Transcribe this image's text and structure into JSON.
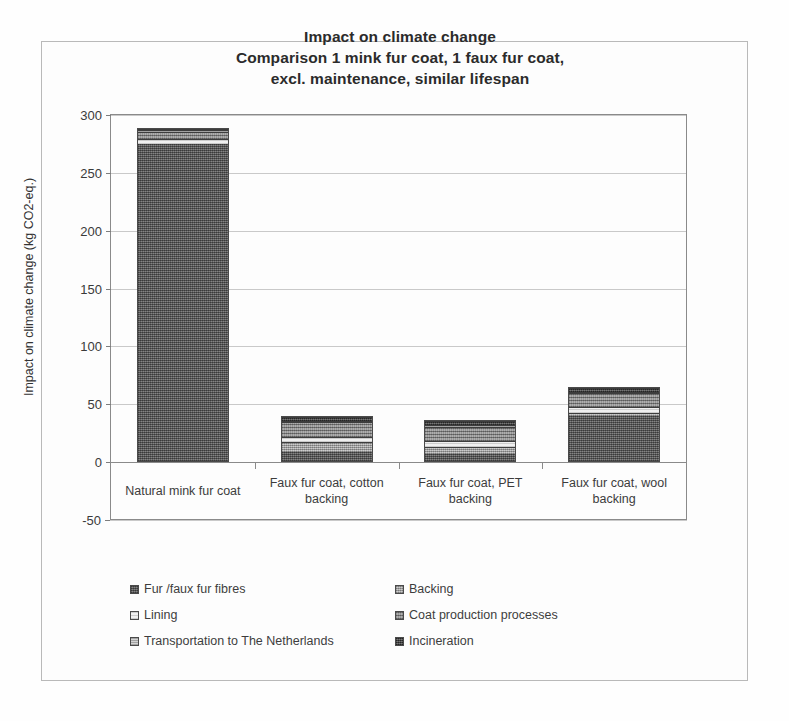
{
  "figure": {
    "title_lines": [
      "Impact on climate change",
      "Comparison 1 mink fur coat, 1 faux fur coat,",
      "excl. maintenance, similar lifespan"
    ]
  },
  "chart_data": {
    "type": "bar",
    "subtype": "stacked-bar",
    "title": "Impact on climate change Comparison 1 mink fur coat, 1 faux fur coat, excl. maintenance, similar lifespan",
    "xlabel": "",
    "ylabel": "Impact on climate change (kg CO2-eq.)",
    "ylim": [
      -50,
      300
    ],
    "yticks": [
      300,
      250,
      200,
      150,
      100,
      50,
      0,
      -50
    ],
    "ytick_labels": [
      "300",
      "250",
      "200",
      "150",
      "100",
      "50",
      "0",
      "-50"
    ],
    "grid": true,
    "legend_position": "bottom",
    "categories": [
      "Natural mink fur coat",
      "Faux fur coat, cotton backing",
      "Faux fur coat, PET backing",
      "Faux fur coat, wool backing"
    ],
    "series": [
      {
        "name": "Fur /faux fur fibres",
        "values": [
          276.0,
          8.0,
          6.0,
          40.0
        ]
      },
      {
        "name": "Backing",
        "values": [
          0.0,
          9.0,
          7.0,
          3.0
        ]
      },
      {
        "name": "Lining",
        "values": [
          4.0,
          5.0,
          5.0,
          5.0
        ]
      },
      {
        "name": "Coat production processes",
        "values": [
          6.0,
          13.0,
          13.0,
          12.0
        ]
      },
      {
        "name": "Transportation to The Netherlands",
        "values": [
          1.5,
          1.5,
          1.5,
          1.5
        ]
      },
      {
        "name": "Incineration",
        "values": [
          1.5,
          3.5,
          3.5,
          3.5
        ]
      }
    ],
    "totals": [
      289.0,
      40.0,
      36.0,
      65.0
    ]
  },
  "legend": {
    "items": [
      {
        "label": "Fur /faux fur fibres",
        "fill": "fill-fibres"
      },
      {
        "label": "Backing",
        "fill": "fill-backing"
      },
      {
        "label": "Lining",
        "fill": "fill-lining"
      },
      {
        "label": "Coat production processes",
        "fill": "fill-coatprod"
      },
      {
        "label": "Transportation to The Netherlands",
        "fill": "fill-transport"
      },
      {
        "label": "Incineration",
        "fill": "fill-incin"
      }
    ]
  },
  "colors": {
    "fibres": "#6a6a6a",
    "backing": "#a8a8a8",
    "lining": "#e3e3e3",
    "coat_production": "#8f8f8f",
    "transportation": "#bdbdbd",
    "incineration": "#4e4e4e",
    "axis": "#8a8a8a",
    "grid": "#c9c9c9",
    "text": "#333333"
  }
}
